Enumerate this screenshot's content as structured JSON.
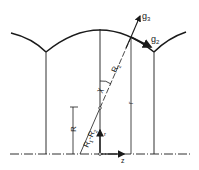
{
  "diagram": {
    "labels": {
      "g3": "g",
      "g3_sub": "3",
      "g2": "g",
      "g2_sub": "2",
      "R2": "R",
      "R2_sub": "2",
      "chi": "χ",
      "r_right": "r",
      "R": "R",
      "R1_minus_R2": "R",
      "R1_sub": "1",
      "minus": "-R",
      "R2b_sub": "2",
      "r_small": "r",
      "z": "z"
    },
    "colors": {
      "stroke": "#1a1a1a",
      "background": "#ffffff"
    }
  }
}
